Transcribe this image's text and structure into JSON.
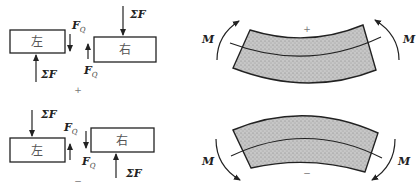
{
  "shear_panels": {
    "positive": {
      "sign": "+",
      "left_block": {
        "label": "左",
        "sum_force_label": "ΣF",
        "sum_force_direction": "up",
        "shear_label": "F",
        "shear_subscript": "Q",
        "shear_direction": "down"
      },
      "right_block": {
        "label": "右",
        "sum_force_label": "ΣF",
        "sum_force_direction": "down",
        "shear_label": "F",
        "shear_subscript": "Q",
        "shear_direction": "up"
      }
    },
    "negative": {
      "sign": "−",
      "left_block": {
        "label": "左",
        "sum_force_label": "ΣF",
        "sum_force_direction": "down",
        "shear_label": "F",
        "shear_subscript": "Q",
        "shear_direction": "up"
      },
      "right_block": {
        "label": "右",
        "sum_force_label": "ΣF",
        "sum_force_direction": "up",
        "shear_label": "F",
        "shear_subscript": "Q",
        "shear_direction": "down"
      }
    }
  },
  "moment_panels": {
    "positive": {
      "sign": "+",
      "moment_label_left": "M",
      "moment_label_right": "M",
      "curvature": "concave-up"
    },
    "negative": {
      "sign": "−",
      "moment_label_left": "M",
      "moment_label_right": "M",
      "curvature": "concave-down"
    }
  },
  "colors": {
    "line": "#222222",
    "fill_stipple": "#bdbdbd",
    "background": "#ffffff"
  }
}
